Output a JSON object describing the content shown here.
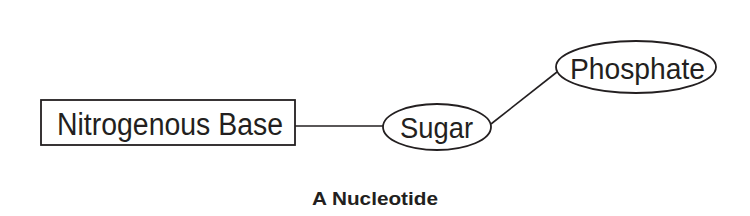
{
  "diagram": {
    "title": "A Nucleotide",
    "nodes": [
      {
        "id": "base",
        "label": "Nitrogenous Base",
        "shape": "rectangle"
      },
      {
        "id": "sugar",
        "label": "Sugar",
        "shape": "ellipse"
      },
      {
        "id": "phosphate",
        "label": "Phosphate",
        "shape": "ellipse"
      }
    ],
    "edges": [
      {
        "from": "base",
        "to": "sugar"
      },
      {
        "from": "sugar",
        "to": "phosphate"
      }
    ],
    "colors": {
      "stroke": "#231f20",
      "background": "#ffffff"
    }
  }
}
